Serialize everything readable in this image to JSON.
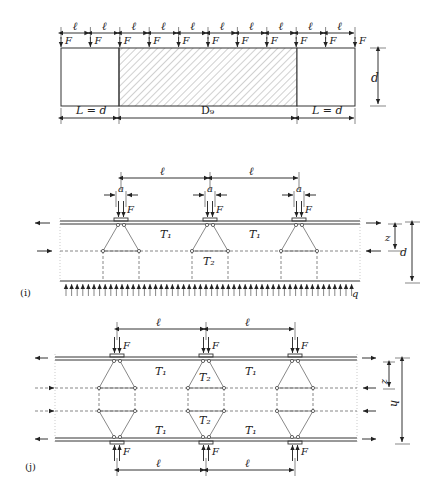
{
  "figure_top": {
    "spacing_label": "ℓ",
    "spacing_count": 10,
    "force_label": "F",
    "force_count": 11,
    "depth_label": "d",
    "left_region_label": "L = d",
    "middle_region_label": "D₉",
    "right_region_label": "L = d"
  },
  "figure_i": {
    "panel_label": "(i)",
    "spacing_label": "ℓ",
    "plate_width_label": "a",
    "force_label": "F",
    "tie_labels": [
      "T₁",
      "T₁"
    ],
    "strut_label": "T₂",
    "lever_arm_label": "z",
    "depth_label": "d",
    "distributed_load_label": "q"
  },
  "figure_j": {
    "panel_label": "(j)",
    "spacing_label": "ℓ",
    "force_label": "F",
    "upper_tie_labels": [
      "T₁",
      "T₁"
    ],
    "lower_tie_labels": [
      "T₁",
      "T₁"
    ],
    "strut_labels": [
      "T₂",
      "T₂"
    ],
    "lever_arm_label": "z",
    "height_label": "h"
  }
}
